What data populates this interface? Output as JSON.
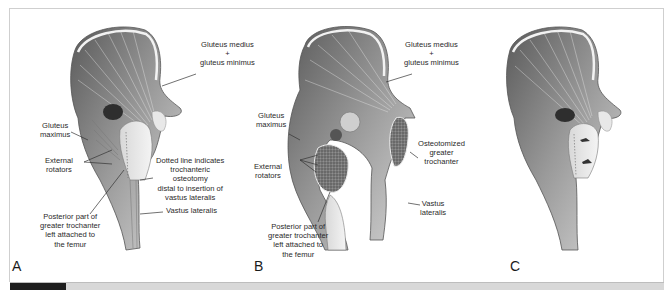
{
  "figure": {
    "panels": [
      {
        "letter": "A",
        "labels": {
          "medius_line1": "Gluteus medius",
          "plus": "+",
          "minimus_line": "gluteus minimus",
          "maximus_line1": "Gluteus",
          "maximus_line2": "maximus",
          "rotators_line1": "External",
          "rotators_line2": "rotators",
          "dotted_line1": "Dotted line indicates",
          "dotted_line2": "trochanteric",
          "dotted_line3": "osteotomy",
          "dotted_line4": "distal to insertion of",
          "dotted_line5": "vastus lateralis",
          "vastus": "Vastus lateralis",
          "posterior_line1": "Posterior part of",
          "posterior_line2": "greater trochanter",
          "posterior_line3": "left attached to",
          "posterior_line4": "the femur"
        }
      },
      {
        "letter": "B",
        "labels": {
          "medius_line1": "Gluteus medius",
          "plus": "+",
          "minimus_line": "gluteus minimus",
          "maximus_line1": "Gluteus",
          "maximus_line2": "maximus",
          "rotators_line1": "External",
          "rotators_line2": "rotators",
          "osteotomized_line1": "Osteotomized",
          "osteotomized_line2": "greater",
          "osteotomized_line3": "trochanter",
          "vastus_line1": "Vastus",
          "vastus_line2": "lateralis",
          "posterior_line1": "Posterior part of",
          "posterior_line2": "greater trochanter",
          "posterior_line3": "left attached to",
          "posterior_line4": "the femur"
        }
      },
      {
        "letter": "C",
        "labels": {}
      }
    ]
  },
  "colors": {
    "frame": "#cfcfcf",
    "bar_dark": "#1e1e1e",
    "bar_light": "#d8d8d8",
    "text": "#2a2a2a"
  }
}
